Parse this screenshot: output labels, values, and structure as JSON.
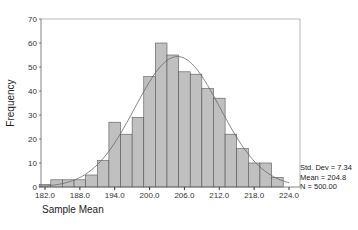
{
  "chart_data": {
    "type": "bar",
    "subtype": "histogram",
    "title": "",
    "xlabel": "Sample Mean",
    "ylabel": "Frequency",
    "ylim": [
      0,
      70
    ],
    "xlim": [
      181,
      223
    ],
    "y_ticks": [
      0,
      10,
      20,
      30,
      40,
      50,
      60,
      70
    ],
    "x_ticks": [
      "182.0",
      "188.0",
      "194.0",
      "200.0",
      "206.0",
      "212.0",
      "218.0",
      "224.0"
    ],
    "x_tick_values": [
      182,
      188,
      194,
      200,
      206,
      212,
      218,
      224
    ],
    "bin_width": 2,
    "categories": [
      182,
      184,
      186,
      188,
      190,
      192,
      194,
      196,
      198,
      200,
      202,
      204,
      206,
      208,
      210,
      212,
      214,
      216,
      218,
      220,
      222
    ],
    "values": [
      1,
      3,
      3,
      3,
      5,
      11,
      27,
      22,
      29,
      46,
      60,
      55,
      48,
      47,
      41,
      37,
      22,
      16,
      10,
      10,
      4
    ],
    "normal_curve": {
      "mean": 204.8,
      "std_dev": 7.34,
      "n": 500
    },
    "grid": false,
    "legend": {
      "position": "right-bottom",
      "entries": [
        "Std. Dev = 7.34",
        "Mean = 204.8",
        "N = 500.00"
      ]
    },
    "bar_color": "#c0c0c0",
    "bar_edge_color": "#555555",
    "curve_color": "#666666"
  },
  "stats": {
    "std_dev": "Std. Dev = 7.34",
    "mean": "Mean = 204.8",
    "n": "N = 500.00"
  }
}
